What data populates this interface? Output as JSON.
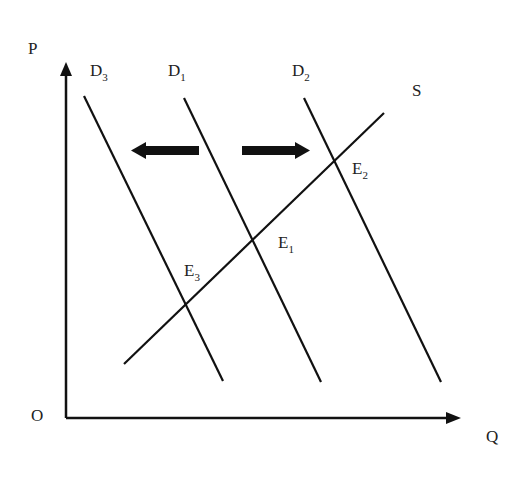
{
  "diagram": {
    "type": "supply-demand",
    "axes": {
      "y_label": "P",
      "x_label": "Q",
      "origin_label": "O"
    },
    "curves": [
      {
        "id": "D3",
        "label_main": "D",
        "label_sub": "3",
        "kind": "demand"
      },
      {
        "id": "D1",
        "label_main": "D",
        "label_sub": "1",
        "kind": "demand"
      },
      {
        "id": "D2",
        "label_main": "D",
        "label_sub": "2",
        "kind": "demand"
      },
      {
        "id": "S",
        "label_main": "S",
        "label_sub": "",
        "kind": "supply"
      }
    ],
    "equilibria": [
      {
        "id": "E1",
        "label_main": "E",
        "label_sub": "1"
      },
      {
        "id": "E2",
        "label_main": "E",
        "label_sub": "2"
      },
      {
        "id": "E3",
        "label_main": "E",
        "label_sub": "3"
      }
    ],
    "shift_arrows": [
      {
        "direction": "left",
        "meaning": "demand decrease D1 to D3"
      },
      {
        "direction": "right",
        "meaning": "demand increase D1 to D2"
      }
    ],
    "colors": {
      "line": "#111111",
      "background": "#ffffff"
    }
  }
}
